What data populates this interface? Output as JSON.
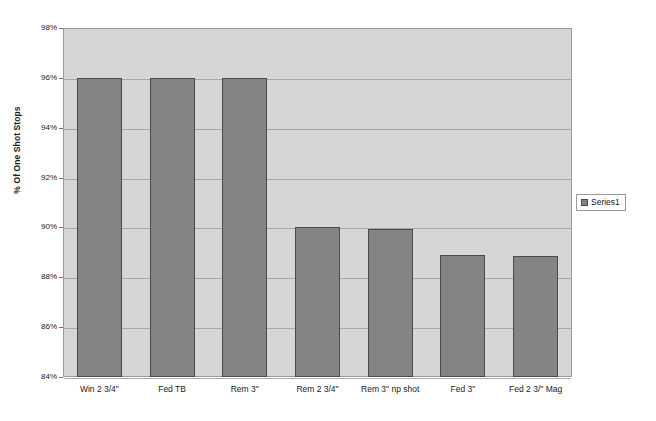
{
  "chart_data": {
    "type": "bar",
    "title": "",
    "subtitle": "",
    "xlabel": "",
    "ylabel": "% Of One Shot Stops",
    "ylim": [
      84,
      98
    ],
    "ytick_values": [
      98,
      96,
      94,
      92,
      90,
      88,
      86,
      84
    ],
    "ytick_labels": [
      "98%",
      "96%",
      "94%",
      "92%",
      "90%",
      "88%",
      "86%",
      "84%"
    ],
    "grid": true,
    "legend_position": "right",
    "categories": [
      "Win 2 3/4\"",
      "Fed TB",
      "Rem 3\"",
      "Rem 2 3/4\"",
      "Rem 3\" np shot",
      "Fed 3\"",
      "Fed 2 3/\" Mag"
    ],
    "series": [
      {
        "name": "Series1",
        "color": "#848484",
        "values": [
          96,
          96,
          96,
          90,
          89.95,
          88.9,
          88.85
        ]
      }
    ],
    "annotations": []
  },
  "legend": {
    "entries": [
      {
        "label": "Series1",
        "swatch_name": "legend-swatch-series1"
      }
    ]
  },
  "colors": {
    "plot_background": "#d6d6d6",
    "page_background": "#ffffff",
    "bar_fill": "#848484",
    "bar_border": "#4a4a4a",
    "gridline": "#a8a8a8",
    "axis_line": "#9a9a9a",
    "text": "#1a1a1a"
  }
}
